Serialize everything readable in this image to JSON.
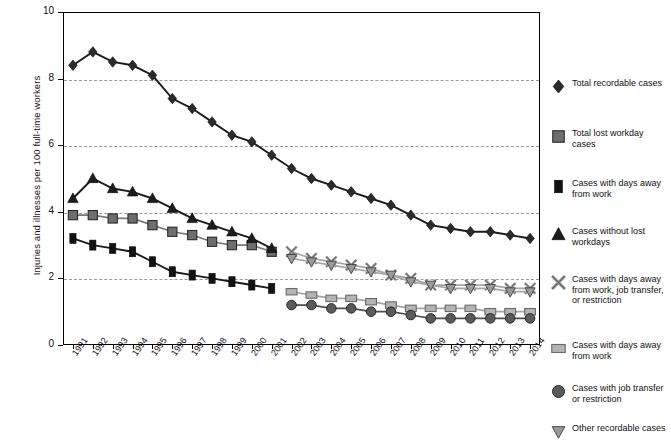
{
  "axes": {
    "ylabel": "Injuries and illnesses per 100 full-time workers",
    "yticks": [
      "0",
      "2",
      "4",
      "6",
      "8",
      "10"
    ],
    "ylim": [
      0,
      10
    ],
    "xticks": [
      "1991",
      "1992",
      "1993",
      "1994",
      "1995",
      "1996",
      "1997",
      "1998",
      "1999",
      "2000",
      "2001",
      "2002",
      "2003",
      "2004",
      "2005",
      "2006",
      "2007",
      "2008",
      "2009",
      "2010",
      "2011",
      "2012",
      "2013",
      "2014"
    ]
  },
  "legend": {
    "items": [
      {
        "marker": "diamond",
        "color": "#2b2b2b",
        "label": "Total recordable cases"
      },
      {
        "marker": "square",
        "color": "#6e6e6e",
        "label": "Total lost workday cases"
      },
      {
        "marker": "bar",
        "color": "#121212",
        "label": "Cases with days away from work"
      },
      {
        "marker": "triangle",
        "color": "#1d1d1d",
        "label": "Cases without lost workdays"
      },
      {
        "marker": "x",
        "color": "#8c8c8c",
        "label": "Cases with days away from work, job transfer, or restriction"
      },
      {
        "marker": "rect",
        "color": "#b4b4b4",
        "label": "Cases with days away from work"
      },
      {
        "marker": "circle",
        "color": "#5a5a5a",
        "label": "Cases with job transfer or restriction"
      },
      {
        "marker": "dtriangle",
        "color": "#9a9a9a",
        "label": "Other recordable cases"
      }
    ]
  },
  "chart_data": {
    "type": "line",
    "title": "",
    "xlabel": "",
    "ylabel": "Injuries and illnesses per 100 full-time workers",
    "ylim": [
      0,
      10
    ],
    "grid": true,
    "legend_position": "right",
    "x": [
      "1991",
      "1992",
      "1993",
      "1994",
      "1995",
      "1996",
      "1997",
      "1998",
      "1999",
      "2000",
      "2001",
      "2002",
      "2003",
      "2004",
      "2005",
      "2006",
      "2007",
      "2008",
      "2009",
      "2010",
      "2011",
      "2012",
      "2013",
      "2014"
    ],
    "series": [
      {
        "name": "Total recordable cases",
        "marker": "diamond",
        "color": "#2b2b2b",
        "x": [
          "1991",
          "1992",
          "1993",
          "1994",
          "1995",
          "1996",
          "1997",
          "1998",
          "1999",
          "2000",
          "2001",
          "2002",
          "2003",
          "2004",
          "2005",
          "2006",
          "2007",
          "2008",
          "2009",
          "2010",
          "2011",
          "2012",
          "2013",
          "2014"
        ],
        "values": [
          8.4,
          8.8,
          8.5,
          8.4,
          8.1,
          7.4,
          7.1,
          6.7,
          6.3,
          6.1,
          5.7,
          5.3,
          5.0,
          4.8,
          4.6,
          4.4,
          4.2,
          3.9,
          3.6,
          3.5,
          3.4,
          3.4,
          3.3,
          3.2
        ],
        "values_end": 3.2
      },
      {
        "name": "Total lost workday cases",
        "marker": "square",
        "color": "#6e6e6e",
        "x": [
          "1991",
          "1992",
          "1993",
          "1994",
          "1995",
          "1996",
          "1997",
          "1998",
          "1999",
          "2000",
          "2001"
        ],
        "values": [
          3.9,
          3.9,
          3.8,
          3.8,
          3.6,
          3.4,
          3.3,
          3.1,
          3.0,
          3.0,
          2.8
        ]
      },
      {
        "name": "Cases with days away from work",
        "marker": "bar",
        "color": "#121212",
        "x": [
          "1991",
          "1992",
          "1993",
          "1994",
          "1995",
          "1996",
          "1997",
          "1998",
          "1999",
          "2000",
          "2001"
        ],
        "values": [
          3.2,
          3.0,
          2.9,
          2.8,
          2.5,
          2.2,
          2.1,
          2.0,
          1.9,
          1.8,
          1.7
        ]
      },
      {
        "name": "Cases without lost workdays",
        "marker": "triangle",
        "color": "#1d1d1d",
        "x": [
          "1991",
          "1992",
          "1993",
          "1994",
          "1995",
          "1996",
          "1997",
          "1998",
          "1999",
          "2000",
          "2001"
        ],
        "values": [
          4.4,
          5.0,
          4.7,
          4.6,
          4.4,
          4.1,
          3.8,
          3.6,
          3.4,
          3.2,
          2.9
        ]
      },
      {
        "name": "Cases with days away from work, job transfer, or restriction",
        "marker": "x",
        "color": "#8c8c8c",
        "x": [
          "2002",
          "2003",
          "2004",
          "2005",
          "2006",
          "2007",
          "2008",
          "2009",
          "2010",
          "2011",
          "2012",
          "2013",
          "2014"
        ],
        "values": [
          2.8,
          2.6,
          2.5,
          2.4,
          2.3,
          2.1,
          2.0,
          1.8,
          1.8,
          1.8,
          1.8,
          1.7,
          1.7
        ]
      },
      {
        "name": "Cases with days away from work",
        "marker": "rect",
        "color": "#b4b4b4",
        "x": [
          "2002",
          "2003",
          "2004",
          "2005",
          "2006",
          "2007",
          "2008",
          "2009",
          "2010",
          "2011",
          "2012",
          "2013",
          "2014"
        ],
        "values": [
          1.6,
          1.5,
          1.4,
          1.4,
          1.3,
          1.2,
          1.1,
          1.1,
          1.1,
          1.1,
          1.0,
          1.0,
          1.0
        ]
      },
      {
        "name": "Cases with job transfer or restriction",
        "marker": "circle",
        "color": "#5a5a5a",
        "x": [
          "2002",
          "2003",
          "2004",
          "2005",
          "2006",
          "2007",
          "2008",
          "2009",
          "2010",
          "2011",
          "2012",
          "2013",
          "2014"
        ],
        "values": [
          1.2,
          1.2,
          1.1,
          1.1,
          1.0,
          1.0,
          0.9,
          0.8,
          0.8,
          0.8,
          0.8,
          0.8,
          0.8
        ]
      },
      {
        "name": "Other recordable cases",
        "marker": "dtriangle",
        "color": "#9a9a9a",
        "x": [
          "2002",
          "2003",
          "2004",
          "2005",
          "2006",
          "2007",
          "2008",
          "2009",
          "2010",
          "2011",
          "2012",
          "2013",
          "2014"
        ],
        "values": [
          2.6,
          2.5,
          2.4,
          2.3,
          2.2,
          2.1,
          1.9,
          1.8,
          1.7,
          1.7,
          1.7,
          1.6,
          1.6
        ]
      }
    ]
  }
}
